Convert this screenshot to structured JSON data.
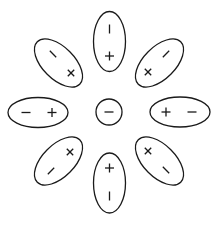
{
  "diagram": {
    "stroke_color": "#1a1a1a",
    "background": "#ffffff",
    "center": {
      "name": "center-circle",
      "cx": 109,
      "cy": 112,
      "r": 13,
      "symbols": [
        "minus"
      ]
    },
    "ellipses": [
      {
        "name": "ellipse-top",
        "cx": 109.5,
        "cy": 41.5,
        "rx": 16,
        "ry": 30,
        "rotate": 0,
        "symbols": [
          {
            "type": "vbar",
            "x": 109.5,
            "y": 29,
            "angle": 0
          },
          {
            "type": "plus",
            "x": 109.5,
            "y": 56,
            "angle": 0
          }
        ]
      },
      {
        "name": "ellipse-upper-right",
        "cx": 159.5,
        "cy": 63,
        "rx": 16,
        "ry": 30,
        "rotate": 45,
        "symbols": [
          {
            "type": "vbar",
            "x": 166,
            "y": 54,
            "angle": 45
          },
          {
            "type": "cross",
            "x": 148,
            "y": 72,
            "angle": 0
          }
        ]
      },
      {
        "name": "ellipse-right",
        "cx": 180,
        "cy": 112,
        "rx": 30,
        "ry": 15,
        "rotate": 0,
        "symbols": [
          {
            "type": "plus",
            "x": 166,
            "y": 112,
            "angle": 0
          },
          {
            "type": "minus",
            "x": 192,
            "y": 112,
            "angle": 0
          }
        ]
      },
      {
        "name": "ellipse-lower-right",
        "cx": 159.5,
        "cy": 161,
        "rx": 16,
        "ry": 30,
        "rotate": -45,
        "symbols": [
          {
            "type": "cross",
            "x": 148,
            "y": 151,
            "angle": 0
          },
          {
            "type": "vbar",
            "x": 166,
            "y": 170,
            "angle": -45
          }
        ]
      },
      {
        "name": "ellipse-bottom",
        "cx": 109.5,
        "cy": 183,
        "rx": 16,
        "ry": 30,
        "rotate": 0,
        "symbols": [
          {
            "type": "plus",
            "x": 109.5,
            "y": 168,
            "angle": 0
          },
          {
            "type": "vbar",
            "x": 109.5,
            "y": 196,
            "angle": 0
          }
        ]
      },
      {
        "name": "ellipse-lower-left",
        "cx": 58.5,
        "cy": 161,
        "rx": 16,
        "ry": 30,
        "rotate": 45,
        "symbols": [
          {
            "type": "cross",
            "x": 70,
            "y": 152,
            "angle": 0
          },
          {
            "type": "vbar",
            "x": 51,
            "y": 171,
            "angle": 45
          }
        ]
      },
      {
        "name": "ellipse-left",
        "cx": 38,
        "cy": 112.5,
        "rx": 30,
        "ry": 15,
        "rotate": 0,
        "symbols": [
          {
            "type": "minus",
            "x": 26,
            "y": 112.5,
            "angle": 0
          },
          {
            "type": "plus",
            "x": 52,
            "y": 112.5,
            "angle": 0
          }
        ]
      },
      {
        "name": "ellipse-upper-left",
        "cx": 58.5,
        "cy": 63,
        "rx": 16,
        "ry": 30,
        "rotate": -45,
        "symbols": [
          {
            "type": "vbar",
            "x": 53,
            "y": 54,
            "angle": -45
          },
          {
            "type": "cross",
            "x": 71,
            "y": 73,
            "angle": 0
          }
        ]
      }
    ],
    "symbol_legend": {
      "plus": "+",
      "minus": "−",
      "cross": "×",
      "vbar": "|"
    }
  }
}
